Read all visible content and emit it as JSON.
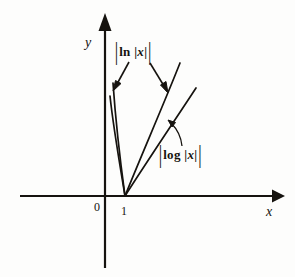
{
  "figure": {
    "background_color": "#fdfdfc",
    "ink_color": "#16130f",
    "axes": {
      "x_axis_label": "x",
      "y_axis_label": "y",
      "origin_label": "0",
      "x_tick_label": "1",
      "x_axis_y_px": 196,
      "y_axis_x_px": 105,
      "x_axis_start_px": 20,
      "x_axis_end_px": 284,
      "y_axis_top_px": 13,
      "y_axis_bottom_px": 268
    },
    "curve_labels": [
      {
        "id": "ln-label",
        "text": "| ln |x| |",
        "outer_bar": "|",
        "function": "ln",
        "inner_bar": "|",
        "variable": "x",
        "points_to": [
          "steep-left-branch",
          "steep-right-branch"
        ]
      },
      {
        "id": "log-label",
        "text": "| log |x| |",
        "outer_bar": "|",
        "function": "log",
        "inner_bar": "|",
        "variable": "x",
        "points_to": [
          "shallow-right-branch"
        ]
      }
    ],
    "curves": [
      {
        "name": "ln-left-outer",
        "description": "steep left branch of |ln |x||",
        "points": [
          [
            113,
            83
          ],
          [
            117,
            118
          ],
          [
            121,
            155
          ],
          [
            125,
            196
          ]
        ]
      },
      {
        "name": "ln-left-inner",
        "description": "steep left branch of |log |x|| (inner, nearly parallel)",
        "points": [
          [
            110,
            96
          ],
          [
            115,
            130
          ],
          [
            120,
            163
          ],
          [
            125,
            196
          ]
        ]
      },
      {
        "name": "ln-right",
        "description": "right branch of |ln |x||",
        "points": [
          [
            180,
            63
          ],
          [
            162,
            108
          ],
          [
            143,
            152
          ],
          [
            125,
            196
          ]
        ]
      },
      {
        "name": "log-right",
        "description": "right branch of |log |x||",
        "points": [
          [
            196,
            88
          ],
          [
            173,
            124
          ],
          [
            149,
            160
          ],
          [
            125,
            196
          ]
        ]
      }
    ],
    "annotation_arrows": [
      {
        "name": "arrow-to-ln-left",
        "from": [
          128,
          60
        ],
        "to": [
          114,
          88
        ]
      },
      {
        "name": "arrow-to-ln-right",
        "from": [
          150,
          62
        ],
        "to": [
          167,
          92
        ]
      },
      {
        "name": "arrow-to-log-right",
        "from": [
          180,
          146
        ],
        "to": [
          170,
          122
        ]
      }
    ]
  }
}
